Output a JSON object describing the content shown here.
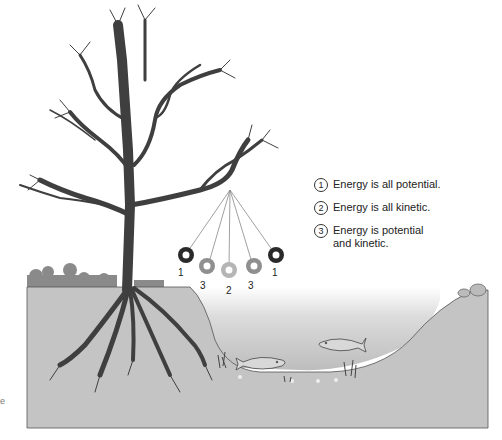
{
  "figure": {
    "colors": {
      "ground": "#c4c4c4",
      "tree": "#3f3f3f",
      "water_top": "#ffffff",
      "water_bottom": "#bdbdbd",
      "bushes": "#8a8a8a",
      "ball_dark": "#2a2a2a",
      "ball_mid": "#8f8f8f",
      "ball_light": "#b5b5b5"
    }
  },
  "legend": {
    "items": [
      {
        "num": "1",
        "text": "Energy is all potential."
      },
      {
        "num": "2",
        "text": "Energy is all kinetic."
      },
      {
        "num": "3",
        "text": "Energy is potential\nand kinetic."
      }
    ]
  },
  "pendulum": {
    "labels": [
      "1",
      "3",
      "2",
      "3",
      "1"
    ]
  },
  "edge_fragment": "e"
}
